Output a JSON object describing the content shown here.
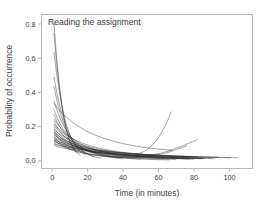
{
  "chart_data": {
    "type": "line",
    "title": "Reading the assignment",
    "xlabel": "Time (in minutes)",
    "ylabel": "Probability of occurrence",
    "xlim": [
      -6,
      113
    ],
    "ylim": [
      -0.045,
      0.855
    ],
    "xticks": [
      0,
      20,
      40,
      60,
      80,
      100
    ],
    "xtick_labels": [
      "0",
      "20",
      "40",
      "60",
      "80",
      "100"
    ],
    "yticks": [
      0.0,
      0.2,
      0.4,
      0.6,
      0.8
    ],
    "ytick_labels": [
      "0.0",
      "0.2",
      "0.4",
      "0.6",
      "0.8"
    ],
    "grid": false,
    "legend": "none",
    "line_color": "#2a2a2a",
    "frame_color": "#b9b9b9",
    "text_color": "#3d3d3d",
    "background": "#ffffff",
    "series_count": 30,
    "series": [
      {
        "name": "curve-01",
        "x": [
          1,
          2,
          3,
          4,
          5,
          6,
          7,
          8,
          9,
          10,
          12,
          14
        ],
        "values": [
          0.812,
          0.675,
          0.556,
          0.452,
          0.364,
          0.291,
          0.231,
          0.182,
          0.143,
          0.112,
          0.069,
          0.043
        ]
      },
      {
        "name": "curve-02",
        "x": [
          1,
          2,
          3,
          4,
          5,
          6,
          7,
          8,
          10,
          12,
          14,
          16
        ],
        "values": [
          0.748,
          0.629,
          0.524,
          0.433,
          0.355,
          0.289,
          0.234,
          0.188,
          0.12,
          0.076,
          0.048,
          0.031
        ]
      },
      {
        "name": "curve-03",
        "x": [
          1,
          3,
          5,
          7,
          9,
          11,
          13,
          15,
          17,
          19
        ],
        "values": [
          0.636,
          0.478,
          0.352,
          0.255,
          0.183,
          0.13,
          0.092,
          0.065,
          0.046,
          0.033
        ]
      },
      {
        "name": "curve-04",
        "x": [
          1,
          3,
          5,
          7,
          9,
          11,
          14,
          17,
          20,
          24
        ],
        "values": [
          0.49,
          0.382,
          0.295,
          0.226,
          0.172,
          0.13,
          0.086,
          0.057,
          0.038,
          0.022
        ]
      },
      {
        "name": "curve-05",
        "x": [
          1,
          3,
          5,
          8,
          11,
          14,
          17,
          20,
          24,
          28
        ],
        "values": [
          0.436,
          0.341,
          0.265,
          0.18,
          0.122,
          0.083,
          0.057,
          0.039,
          0.024,
          0.015
        ]
      },
      {
        "name": "curve-06",
        "x": [
          1,
          4,
          8,
          13,
          19,
          26,
          34,
          43,
          53,
          64,
          68
        ],
        "values": [
          0.336,
          0.298,
          0.255,
          0.213,
          0.176,
          0.143,
          0.116,
          0.094,
          0.077,
          0.065,
          0.062
        ]
      },
      {
        "name": "curve-07",
        "x": [
          1,
          3,
          6,
          9,
          13,
          17,
          22,
          27,
          33,
          40
        ],
        "values": [
          0.352,
          0.288,
          0.215,
          0.16,
          0.111,
          0.077,
          0.05,
          0.033,
          0.02,
          0.011
        ]
      },
      {
        "name": "curve-08",
        "x": [
          1,
          3,
          6,
          10,
          15,
          21,
          28,
          36,
          45,
          55,
          66
        ],
        "values": [
          0.3,
          0.248,
          0.189,
          0.134,
          0.09,
          0.058,
          0.036,
          0.022,
          0.013,
          0.008,
          0.005
        ]
      },
      {
        "name": "curve-09",
        "x": [
          1,
          3,
          6,
          10,
          14,
          19,
          25,
          32,
          40,
          50
        ],
        "values": [
          0.272,
          0.224,
          0.171,
          0.123,
          0.089,
          0.062,
          0.042,
          0.027,
          0.017,
          0.01
        ]
      },
      {
        "name": "curve-10",
        "x": [
          1,
          4,
          8,
          13,
          19,
          26,
          34,
          43,
          54,
          66,
          78
        ],
        "values": [
          0.245,
          0.202,
          0.158,
          0.118,
          0.085,
          0.06,
          0.042,
          0.03,
          0.021,
          0.015,
          0.011
        ]
      },
      {
        "name": "curve-11",
        "x": [
          1,
          3,
          6,
          10,
          15,
          21,
          28,
          37,
          47,
          58,
          70
        ],
        "values": [
          0.232,
          0.195,
          0.153,
          0.113,
          0.08,
          0.055,
          0.037,
          0.024,
          0.016,
          0.011,
          0.008
        ]
      },
      {
        "name": "curve-12",
        "x": [
          1,
          4,
          9,
          15,
          22,
          30,
          39,
          49,
          60,
          72,
          82
        ],
        "values": [
          0.215,
          0.182,
          0.145,
          0.112,
          0.086,
          0.066,
          0.051,
          0.04,
          0.032,
          0.026,
          0.023
        ]
      },
      {
        "name": "curve-13",
        "x": [
          1,
          4,
          8,
          14,
          21,
          29,
          38,
          48,
          59,
          71
        ],
        "values": [
          0.206,
          0.17,
          0.135,
          0.1,
          0.073,
          0.053,
          0.038,
          0.028,
          0.02,
          0.015
        ]
      },
      {
        "name": "curve-14",
        "x": [
          1,
          3,
          7,
          12,
          18,
          25,
          33,
          42,
          52,
          63
        ],
        "values": [
          0.195,
          0.165,
          0.127,
          0.093,
          0.067,
          0.048,
          0.034,
          0.024,
          0.017,
          0.012
        ]
      },
      {
        "name": "curve-15",
        "x": [
          1,
          4,
          9,
          16,
          24,
          33,
          43,
          54,
          66,
          79
        ],
        "values": [
          0.185,
          0.158,
          0.126,
          0.097,
          0.074,
          0.056,
          0.043,
          0.033,
          0.025,
          0.019
        ]
      },
      {
        "name": "curve-16",
        "x": [
          1,
          3,
          7,
          12,
          19,
          27,
          36,
          46,
          57,
          69,
          80
        ],
        "values": [
          0.178,
          0.151,
          0.118,
          0.088,
          0.063,
          0.045,
          0.032,
          0.023,
          0.017,
          0.013,
          0.01
        ]
      },
      {
        "name": "curve-17",
        "x": [
          1,
          4,
          9,
          16,
          25,
          35,
          46,
          58,
          71,
          85
        ],
        "values": [
          0.168,
          0.143,
          0.113,
          0.085,
          0.062,
          0.045,
          0.033,
          0.024,
          0.018,
          0.013
        ]
      },
      {
        "name": "curve-18",
        "x": [
          1,
          3,
          8,
          14,
          22,
          31,
          41,
          52,
          64,
          77
        ],
        "values": [
          0.158,
          0.136,
          0.106,
          0.08,
          0.058,
          0.042,
          0.03,
          0.022,
          0.016,
          0.012
        ]
      },
      {
        "name": "curve-19",
        "x": [
          1,
          5,
          11,
          19,
          28,
          39,
          51,
          64,
          78,
          90
        ],
        "values": [
          0.151,
          0.128,
          0.102,
          0.079,
          0.06,
          0.046,
          0.035,
          0.027,
          0.021,
          0.017
        ]
      },
      {
        "name": "curve-20",
        "x": [
          1,
          4,
          10,
          17,
          26,
          36,
          47,
          59,
          72,
          86
        ],
        "values": [
          0.142,
          0.122,
          0.096,
          0.074,
          0.055,
          0.041,
          0.031,
          0.023,
          0.017,
          0.013
        ]
      },
      {
        "name": "curve-21",
        "x": [
          1,
          4,
          9,
          16,
          24,
          34,
          45,
          57,
          70,
          84
        ],
        "values": [
          0.132,
          0.113,
          0.09,
          0.069,
          0.052,
          0.038,
          0.028,
          0.021,
          0.016,
          0.012
        ]
      },
      {
        "name": "curve-22",
        "x": [
          1,
          5,
          12,
          21,
          32,
          44,
          57,
          71,
          86,
          101
        ],
        "values": [
          0.125,
          0.108,
          0.088,
          0.07,
          0.055,
          0.043,
          0.034,
          0.027,
          0.021,
          0.017
        ]
      },
      {
        "name": "curve-23",
        "x": [
          1,
          4,
          10,
          18,
          28,
          39,
          51,
          64,
          78,
          92
        ],
        "values": [
          0.118,
          0.102,
          0.082,
          0.063,
          0.048,
          0.036,
          0.027,
          0.021,
          0.016,
          0.012
        ]
      },
      {
        "name": "curve-24",
        "x": [
          1,
          5,
          12,
          22,
          33,
          46,
          60,
          75,
          90,
          105
        ],
        "values": [
          0.112,
          0.098,
          0.08,
          0.064,
          0.051,
          0.041,
          0.033,
          0.027,
          0.022,
          0.018
        ]
      },
      {
        "name": "curve-25",
        "x": [
          1,
          4,
          11,
          20,
          31,
          43,
          56,
          70,
          85
        ],
        "values": [
          0.105,
          0.091,
          0.074,
          0.058,
          0.045,
          0.035,
          0.027,
          0.021,
          0.016
        ]
      },
      {
        "name": "curve-26",
        "x": [
          1,
          5,
          13,
          24,
          36,
          50,
          64,
          79,
          94
        ],
        "values": [
          0.098,
          0.086,
          0.071,
          0.057,
          0.046,
          0.037,
          0.03,
          0.024,
          0.02
        ]
      },
      {
        "name": "curve-27",
        "x": [
          1,
          4,
          12,
          22,
          34,
          47,
          61,
          76
        ],
        "values": [
          0.09,
          0.079,
          0.064,
          0.051,
          0.04,
          0.032,
          0.025,
          0.02
        ]
      },
      {
        "name": "curve-28-upturn",
        "x": [
          1,
          6,
          14,
          24,
          35,
          45,
          53,
          59,
          63,
          66,
          67
        ],
        "values": [
          0.168,
          0.108,
          0.063,
          0.036,
          0.024,
          0.031,
          0.062,
          0.122,
          0.191,
          0.255,
          0.288
        ]
      },
      {
        "name": "curve-29-upturn",
        "x": [
          1,
          6,
          15,
          26,
          38,
          50,
          60,
          68,
          75,
          80,
          82
        ],
        "values": [
          0.142,
          0.092,
          0.053,
          0.031,
          0.021,
          0.026,
          0.042,
          0.066,
          0.094,
          0.115,
          0.124
        ]
      },
      {
        "name": "curve-30-upturn",
        "x": [
          1,
          7,
          17,
          29,
          41,
          52,
          61,
          68,
          73,
          76
        ],
        "values": [
          0.122,
          0.079,
          0.046,
          0.027,
          0.019,
          0.024,
          0.038,
          0.058,
          0.077,
          0.088
        ]
      }
    ]
  }
}
